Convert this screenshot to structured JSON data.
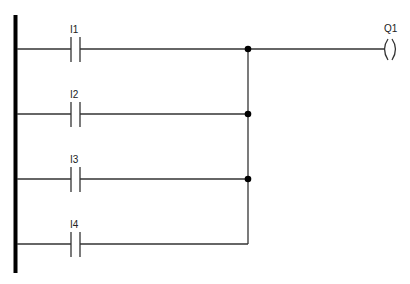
{
  "diagram": {
    "type": "ladder-logic",
    "rail_color": "#000000",
    "wire_color": "#333333",
    "rungs": [
      {
        "contact_label": "I1",
        "y": 49,
        "junction": true
      },
      {
        "contact_label": "I2",
        "y": 114,
        "junction": true
      },
      {
        "contact_label": "I3",
        "y": 179,
        "junction": true
      },
      {
        "contact_label": "I4",
        "y": 244,
        "junction": false
      }
    ],
    "coil": {
      "label": "Q1"
    },
    "logic": "Q1 = I1 OR I2 OR I3 OR I4"
  }
}
